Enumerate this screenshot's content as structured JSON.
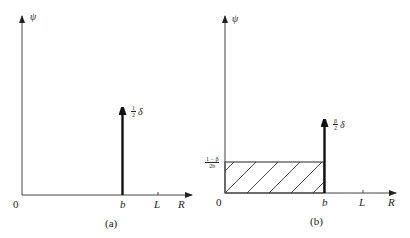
{
  "panels": [
    {
      "id": "a",
      "caption": "(a)",
      "y_axis_label": "ψ",
      "x_axis_label": "R",
      "origin_label": "0",
      "x_ticks": [
        "b",
        "L"
      ],
      "spike": {
        "position": "b",
        "label_num": "1",
        "label_den": "2",
        "label_sym": "δ"
      }
    },
    {
      "id": "b",
      "caption": "(b)",
      "y_axis_label": "ψ",
      "x_axis_label": "R",
      "origin_label": "0",
      "x_ticks": [
        "b",
        "L"
      ],
      "y_tick": {
        "num": "1 − β",
        "den": "2b"
      },
      "spike": {
        "position": "b",
        "label_num": "β",
        "label_den": "2",
        "label_sym": "δ"
      },
      "hatched_region": {
        "from": "0",
        "to": "b",
        "height": "(1−β)/2b"
      }
    }
  ]
}
